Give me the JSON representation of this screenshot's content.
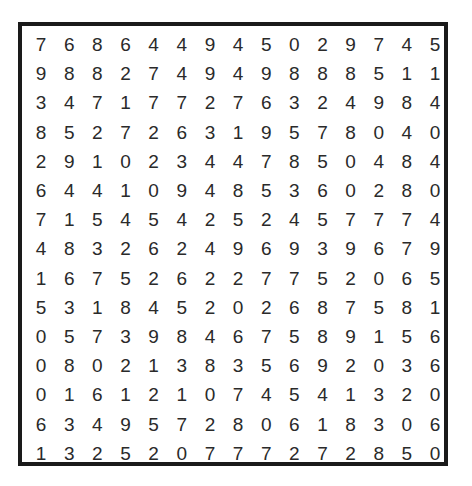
{
  "puzzle": {
    "grid": [
      [
        "7",
        "6",
        "8",
        "6",
        "4",
        "4",
        "9",
        "4",
        "5",
        "0",
        "2",
        "9",
        "7",
        "4",
        "5"
      ],
      [
        "9",
        "8",
        "8",
        "2",
        "7",
        "4",
        "9",
        "4",
        "9",
        "8",
        "8",
        "8",
        "5",
        "1",
        "1"
      ],
      [
        "3",
        "4",
        "7",
        "1",
        "7",
        "7",
        "2",
        "7",
        "6",
        "3",
        "2",
        "4",
        "9",
        "8",
        "4"
      ],
      [
        "8",
        "5",
        "2",
        "7",
        "2",
        "6",
        "3",
        "1",
        "9",
        "5",
        "7",
        "8",
        "0",
        "4",
        "0"
      ],
      [
        "2",
        "9",
        "1",
        "0",
        "2",
        "3",
        "4",
        "4",
        "7",
        "8",
        "5",
        "0",
        "4",
        "8",
        "4"
      ],
      [
        "6",
        "4",
        "4",
        "1",
        "0",
        "9",
        "4",
        "8",
        "5",
        "3",
        "6",
        "0",
        "2",
        "8",
        "0"
      ],
      [
        "7",
        "1",
        "5",
        "4",
        "5",
        "4",
        "2",
        "5",
        "2",
        "4",
        "5",
        "7",
        "7",
        "7",
        "4"
      ],
      [
        "4",
        "8",
        "3",
        "2",
        "6",
        "2",
        "4",
        "9",
        "6",
        "9",
        "3",
        "9",
        "6",
        "7",
        "9"
      ],
      [
        "1",
        "6",
        "7",
        "5",
        "2",
        "6",
        "2",
        "2",
        "7",
        "7",
        "5",
        "2",
        "0",
        "6",
        "5"
      ],
      [
        "5",
        "3",
        "1",
        "8",
        "4",
        "5",
        "2",
        "0",
        "2",
        "6",
        "8",
        "7",
        "5",
        "8",
        "1"
      ],
      [
        "0",
        "5",
        "7",
        "3",
        "9",
        "8",
        "4",
        "6",
        "7",
        "5",
        "8",
        "9",
        "1",
        "5",
        "6"
      ],
      [
        "0",
        "8",
        "0",
        "2",
        "1",
        "3",
        "8",
        "3",
        "5",
        "6",
        "9",
        "2",
        "0",
        "3",
        "6"
      ],
      [
        "0",
        "1",
        "6",
        "1",
        "2",
        "1",
        "0",
        "7",
        "4",
        "5",
        "4",
        "1",
        "3",
        "2",
        "0"
      ],
      [
        "6",
        "3",
        "4",
        "9",
        "5",
        "7",
        "2",
        "8",
        "0",
        "6",
        "1",
        "8",
        "3",
        "0",
        "6"
      ],
      [
        "1",
        "3",
        "2",
        "5",
        "2",
        "0",
        "7",
        "7",
        "7",
        "2",
        "7",
        "2",
        "8",
        "5",
        "0"
      ]
    ]
  }
}
